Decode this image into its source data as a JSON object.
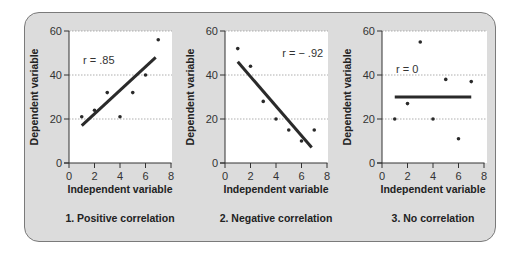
{
  "chart_data": [
    {
      "type": "scatter",
      "title": "1. Positive correlation",
      "xlabel": "Independent variable",
      "ylabel": "Dependent variable",
      "xlim": [
        0,
        8
      ],
      "ylim": [
        0,
        60
      ],
      "xticks": [
        0,
        2,
        4,
        6,
        8
      ],
      "yticks": [
        0,
        20,
        40,
        60
      ],
      "grid": "horizontal dotted at 20, 40, 60",
      "annotation": "r = .85",
      "points": [
        [
          1,
          21
        ],
        [
          2,
          24
        ],
        [
          3,
          32
        ],
        [
          4,
          21
        ],
        [
          5,
          32
        ],
        [
          6,
          40
        ],
        [
          7,
          56
        ]
      ],
      "fit_line": [
        [
          1,
          17
        ],
        [
          6.8,
          48
        ]
      ]
    },
    {
      "type": "scatter",
      "title": "2. Negative correlation",
      "xlabel": "Independent variable",
      "ylabel": "Dependent variable",
      "xlim": [
        0,
        8
      ],
      "ylim": [
        0,
        60
      ],
      "xticks": [
        0,
        2,
        4,
        6,
        8
      ],
      "yticks": [
        0,
        20,
        40,
        60
      ],
      "grid": "horizontal dotted at 20, 40, 60",
      "annotation": "r = − .92",
      "points": [
        [
          1,
          52
        ],
        [
          2,
          44
        ],
        [
          3,
          28
        ],
        [
          4,
          20
        ],
        [
          5,
          15
        ],
        [
          6,
          10
        ],
        [
          7,
          15
        ]
      ],
      "fit_line": [
        [
          1,
          46
        ],
        [
          6.8,
          7
        ]
      ]
    },
    {
      "type": "scatter",
      "title": "3. No correlation",
      "xlabel": "Independent variable",
      "ylabel": "Dependent variable",
      "xlim": [
        0,
        8
      ],
      "ylim": [
        0,
        60
      ],
      "xticks": [
        0,
        2,
        4,
        6,
        8
      ],
      "yticks": [
        0,
        20,
        40,
        60
      ],
      "grid": "horizontal dotted at 20, 40, 60",
      "annotation": "r = 0",
      "points": [
        [
          1,
          20
        ],
        [
          2,
          27
        ],
        [
          3,
          55
        ],
        [
          4,
          20
        ],
        [
          5,
          38
        ],
        [
          6,
          11
        ],
        [
          7,
          37
        ]
      ],
      "fit_line": [
        [
          1,
          30
        ],
        [
          7,
          30
        ]
      ]
    }
  ],
  "layout": {
    "panels": [
      {
        "x0": 69,
        "x8": 171,
        "plot_right": 172
      },
      {
        "x0": 225,
        "x8": 327,
        "plot_right": 328
      },
      {
        "x0": 382,
        "x8": 484,
        "plot_right": 487
      }
    ],
    "y0": 163,
    "y60": 31,
    "colors": {
      "frame_bg": "#dcdcdc",
      "frame_border": "#7a7a7a",
      "plot_bg": "#ffffff",
      "ink": "#333333",
      "grid": "#9a9a9a"
    }
  }
}
